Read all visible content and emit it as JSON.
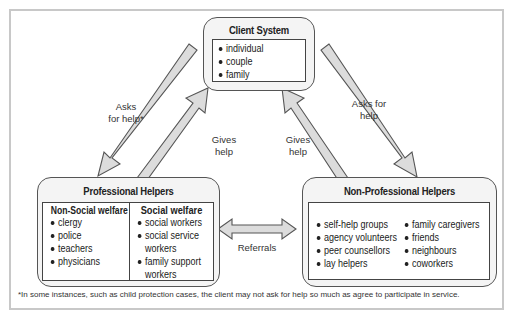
{
  "diagram": {
    "client_system": {
      "title": "Client System",
      "items": [
        "individual",
        "couple",
        "family"
      ]
    },
    "professional_helpers": {
      "title": "Professional Helpers",
      "non_social_welfare": {
        "heading": "Non-Social welfare",
        "items": [
          "clergy",
          "police",
          "teachers",
          "physicians"
        ]
      },
      "social_welfare": {
        "heading": "Social welfare",
        "items": [
          "social workers",
          "social service",
          "workers",
          "family support",
          "workers"
        ]
      }
    },
    "non_professional_helpers": {
      "title": "Non-Professional Helpers",
      "col1": [
        "self-help groups",
        "agency volunteers",
        "peer counsellors",
        "lay helpers"
      ],
      "col2": [
        "family caregivers",
        "friends",
        "neighbours",
        "coworkers"
      ]
    },
    "arrows": {
      "left_asks_l1": "Asks",
      "left_asks_l2": "for help*",
      "left_gives_l1": "Gives",
      "left_gives_l2": "help",
      "right_asks_l1": "Asks for",
      "right_asks_l2": "help",
      "right_gives_l1": "Gives",
      "right_gives_l2": "help",
      "referrals": "Referrals"
    },
    "footnote": "*In some instances, such as child protection cases, the client may not ask for help so much as agree to participate in service."
  }
}
